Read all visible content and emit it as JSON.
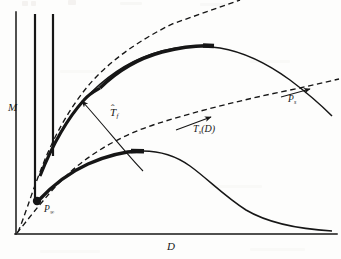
{
  "figure": {
    "background_color": "#fdfdfc",
    "ink_color": "#161616",
    "axes": {
      "y_label": "M",
      "x_label": "D",
      "origin": {
        "x": 16,
        "y": 234
      },
      "x_axis_end": {
        "x": 336,
        "y": 234
      },
      "y_axis_top": {
        "x": 16,
        "y": 12
      }
    },
    "labels": {
      "axis_m": "M",
      "axis_d": "D",
      "point_infinity": {
        "base": "P",
        "sub": "∞"
      },
      "point_s": {
        "base": "P",
        "sub": "s"
      },
      "curve_t_hat_f": {
        "base": "T",
        "hat": "ˆ",
        "sub": "f"
      },
      "curve_t_s_of_d": {
        "base": "T",
        "sub": "s",
        "arg": "(D)"
      }
    },
    "markers": [
      {
        "name": "P-infinity-dot",
        "x": 37,
        "y": 201,
        "r": 4.2
      }
    ],
    "vertical_lines": [
      {
        "name": "asymptote-line-1",
        "x": 35,
        "y_top": 14,
        "y_bottom": 199
      },
      {
        "name": "asymptote-line-2",
        "x": 53,
        "y_top": 14,
        "y_bottom": 156
      }
    ],
    "curves": {
      "upper_solid": {
        "description": "upper bold curve rising from the left asymptote, peaking near D mid-right then falling",
        "peak": {
          "x": 218,
          "y": 48
        },
        "thick_segment": {
          "from_x": 100,
          "to_x": 212
        }
      },
      "lower_solid": {
        "description": "lower bold curve from P-infinity rising to a broad maximum then decaying to the right",
        "peak": {
          "x": 140,
          "y": 152
        },
        "thick_segment": {
          "from_x": 37,
          "to_x": 143
        }
      },
      "dashed_upper": {
        "description": "dashed tangent curve from origin following the upper curve and continuing straight up-right"
      },
      "dashed_lower": {
        "description": "dashed curve T_s(D) from origin rising gently and crossing the upper curve at P_s"
      }
    },
    "arrows": [
      {
        "name": "t-hat-f-pointer",
        "from": {
          "x": 140,
          "y": 170
        },
        "to": {
          "x": 78,
          "y": 97
        }
      },
      {
        "name": "t-s-d-pointer",
        "from": {
          "x": 178,
          "y": 129
        },
        "to": {
          "x": 213,
          "y": 116
        }
      },
      {
        "name": "p-s-pointer",
        "from": {
          "x": 279,
          "y": 96
        },
        "to": {
          "x": 311,
          "y": 88
        }
      }
    ]
  }
}
